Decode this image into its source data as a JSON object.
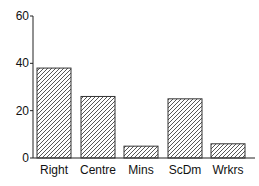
{
  "chart_data": {
    "type": "bar",
    "title": "",
    "xlabel": "",
    "ylabel": "",
    "categories": [
      "Right",
      "Centre",
      "Mins",
      "ScDm",
      "Wrkrs"
    ],
    "values": [
      38,
      26,
      5,
      25,
      6
    ],
    "ylim": [
      0,
      60
    ],
    "yticks": [
      0,
      20,
      40,
      60
    ],
    "grid": false,
    "legend": null,
    "bar_fill": "diagonal-hatch",
    "colors": {
      "bar_edge": "#333333",
      "hatch": "#444444",
      "axis": "#222222"
    }
  }
}
